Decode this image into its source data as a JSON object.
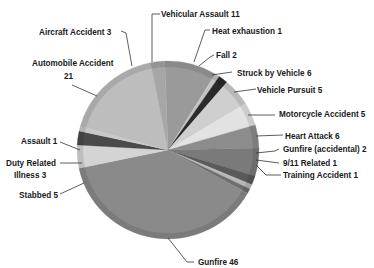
{
  "chart_data": {
    "type": "pie",
    "title": "",
    "total": 119,
    "start_angle_deg": -2,
    "direction": "clockwise",
    "slices": [
      {
        "label": "Vehicular Assault",
        "value": 11,
        "color": "#9a9a9a"
      },
      {
        "label": "Heat exhaustion",
        "value": 1,
        "color": "#c4c4c4"
      },
      {
        "label": "Fall",
        "value": 2,
        "color": "#2a2a2a"
      },
      {
        "label": "Struck by Vehicle",
        "value": 6,
        "color": "#cfcfcf"
      },
      {
        "label": "Vehicle Pursuit",
        "value": 5,
        "color": "#e2e2e2"
      },
      {
        "label": "Motorcycle Accident",
        "value": 5,
        "color": "#8c8c8c"
      },
      {
        "label": "Heart Attack",
        "value": 6,
        "color": "#7a7a7a"
      },
      {
        "label": "Gunfire (accidental)",
        "value": 2,
        "color": "#5a5a5a"
      },
      {
        "label": "9/11 Related",
        "value": 1,
        "color": "#b8b8b8"
      },
      {
        "label": "Training Accident",
        "value": 1,
        "color": "#6e6e6e"
      },
      {
        "label": "Gunfire",
        "value": 46,
        "color": "#8a8a8a"
      },
      {
        "label": "Stabbed",
        "value": 5,
        "color": "#d4d4d4"
      },
      {
        "label": "Duty Related Illness",
        "value": 3,
        "color": "#4a4a4a"
      },
      {
        "label": "Assault",
        "value": 1,
        "color": "#c8c8c8"
      },
      {
        "label": "Automobile Accident",
        "value": 21,
        "color": "#bdbdbd"
      },
      {
        "label": "Aircraft Accident",
        "value": 3,
        "color": "#a6a6a6"
      }
    ],
    "legend": "none (callout labels)"
  },
  "labels": {
    "vehicular_assault": "Vehicular Assault 11",
    "heat_exhaustion": "Heat exhaustion 1",
    "fall": "Fall 2",
    "struck_by_vehicle": "Struck by Vehicle 6",
    "vehicle_pursuit": "Vehicle Pursuit 5",
    "motorcycle_accident": "Motorcycle Accident 5",
    "heart_attack": "Heart Attack 6",
    "gunfire_accidental": "Gunfire (accidental) 2",
    "nine_eleven": "9/11 Related 1",
    "training_accident": "Training Accident 1",
    "gunfire": "Gunfire 46",
    "stabbed": "Stabbed 5",
    "duty_related_1": "Duty Related",
    "duty_related_2": "Illness 3",
    "assault": "Assault 1",
    "automobile_1": "Automobile Accident",
    "automobile_2": "21",
    "aircraft": "Aircraft Accident 3"
  }
}
